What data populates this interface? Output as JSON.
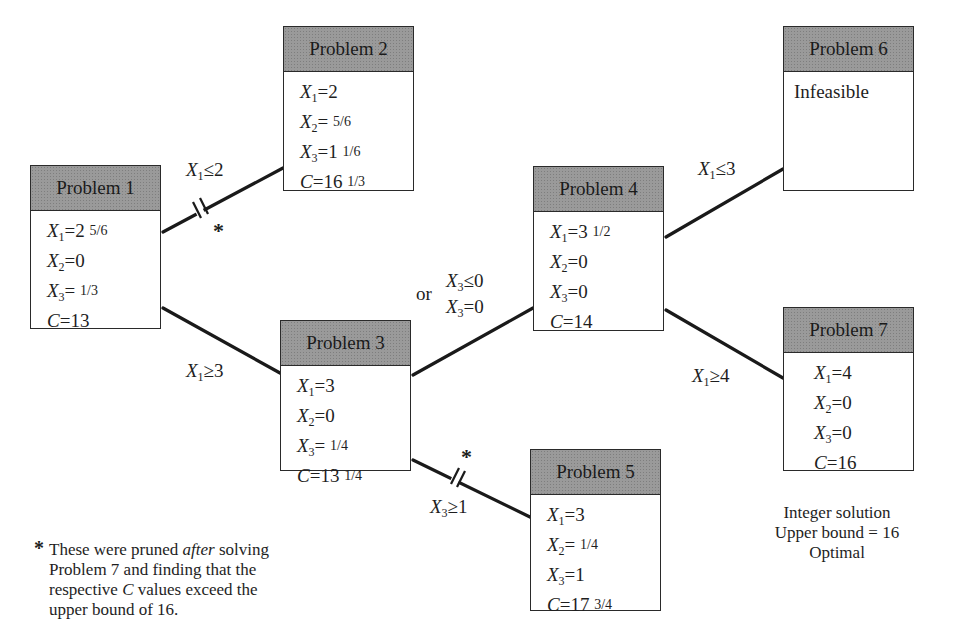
{
  "nodes": [
    {
      "id": "p1",
      "title": "Problem 1",
      "lines": [
        {
          "var": "X",
          "sub": "1",
          "eq": "=2 ",
          "frac": "5/6"
        },
        {
          "var": "X",
          "sub": "2",
          "eq": "=0",
          "frac": ""
        },
        {
          "var": "X",
          "sub": "3",
          "eq": "= ",
          "frac": "1/3"
        },
        {
          "var": "C",
          "sub": "",
          "eq": "=13",
          "frac": ""
        }
      ]
    },
    {
      "id": "p2",
      "title": "Problem 2",
      "lines": [
        {
          "var": "X",
          "sub": "1",
          "eq": "=2",
          "frac": ""
        },
        {
          "var": "X",
          "sub": "2",
          "eq": "= ",
          "frac": "5/6"
        },
        {
          "var": "X",
          "sub": "3",
          "eq": "=1 ",
          "frac": "1/6"
        },
        {
          "var": "C",
          "sub": "",
          "eq": "=16 ",
          "frac": "1/3"
        }
      ]
    },
    {
      "id": "p3",
      "title": "Problem 3",
      "lines": [
        {
          "var": "X",
          "sub": "1",
          "eq": "=3",
          "frac": ""
        },
        {
          "var": "X",
          "sub": "2",
          "eq": "=0",
          "frac": ""
        },
        {
          "var": "X",
          "sub": "3",
          "eq": "= ",
          "frac": "1/4"
        },
        {
          "var": "C",
          "sub": "",
          "eq": "=13 ",
          "frac": "1/4"
        }
      ]
    },
    {
      "id": "p4",
      "title": "Problem 4",
      "lines": [
        {
          "var": "X",
          "sub": "1",
          "eq": "=3 ",
          "frac": "1/2"
        },
        {
          "var": "X",
          "sub": "2",
          "eq": "=0",
          "frac": ""
        },
        {
          "var": "X",
          "sub": "3",
          "eq": "=0",
          "frac": ""
        },
        {
          "var": "C",
          "sub": "",
          "eq": "=14",
          "frac": ""
        }
      ]
    },
    {
      "id": "p5",
      "title": "Problem 5",
      "lines": [
        {
          "var": "X",
          "sub": "1",
          "eq": "=3",
          "frac": ""
        },
        {
          "var": "X",
          "sub": "2",
          "eq": "= ",
          "frac": "1/4"
        },
        {
          "var": "X",
          "sub": "3",
          "eq": "=1",
          "frac": ""
        },
        {
          "var": "C",
          "sub": "",
          "eq": "=17 ",
          "frac": "3/4"
        }
      ]
    },
    {
      "id": "p6",
      "title": "Problem 6",
      "status": "Infeasible"
    },
    {
      "id": "p7",
      "title": "Problem 7",
      "lines": [
        {
          "var": "X",
          "sub": "1",
          "eq": "=4",
          "frac": ""
        },
        {
          "var": "X",
          "sub": "2",
          "eq": "=0",
          "frac": ""
        },
        {
          "var": "X",
          "sub": "3",
          "eq": "=0",
          "frac": ""
        },
        {
          "var": "C",
          "sub": "",
          "eq": "=16",
          "frac": ""
        }
      ]
    }
  ],
  "edges": [
    {
      "from": "p1",
      "to": "p2",
      "var": "X",
      "sub": "1",
      "rel": "≤2",
      "pruned": true
    },
    {
      "from": "p1",
      "to": "p3",
      "var": "X",
      "sub": "1",
      "rel": "≥3",
      "pruned": false
    },
    {
      "from": "p3",
      "to": "p4",
      "var": "X",
      "sub": "3",
      "rel": "≤0",
      "alt_prefix": "or",
      "alt_rel": "=0",
      "pruned": false
    },
    {
      "from": "p3",
      "to": "p5",
      "var": "X",
      "sub": "3",
      "rel": "≥1",
      "pruned": true
    },
    {
      "from": "p4",
      "to": "p6",
      "var": "X",
      "sub": "1",
      "rel": "≤3",
      "pruned": false
    },
    {
      "from": "p4",
      "to": "p7",
      "var": "X",
      "sub": "1",
      "rel": "≥4",
      "pruned": false
    }
  ],
  "prune_marker": "*",
  "footnote": {
    "bullet": "*",
    "line1_a": "These were pruned ",
    "line1_em": "after",
    "line1_b": " solving",
    "line2": "Problem 7 and finding that the",
    "line3_a": "respective ",
    "line3_em": "C",
    "line3_b": " values exceed the",
    "line4": "upper bound of 16."
  },
  "summary": {
    "line1": "Integer solution",
    "line2": "Upper bound = 16",
    "line3": "Optimal"
  },
  "colors": {
    "header_fill": "#9a9a9a",
    "line": "#1a1a1a",
    "background": "#ffffff"
  }
}
